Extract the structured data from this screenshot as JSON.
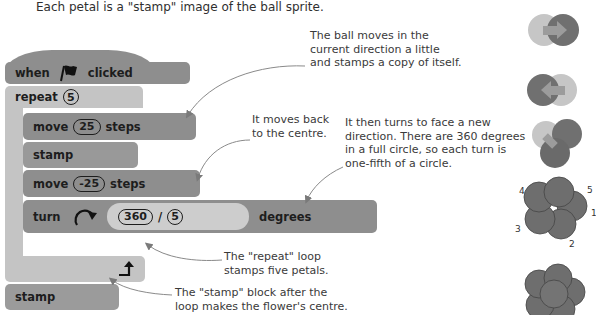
{
  "intro": {
    "line1_partial": "...",
    "line2": "Each petal is a \"stamp\" image of the ball sprite."
  },
  "script": {
    "hat": {
      "when": "when",
      "icon": "green-flag-icon",
      "clicked": "clicked"
    },
    "repeat": {
      "label": "repeat",
      "count": "5",
      "end_icon": "loop-arrow-icon"
    },
    "move1": {
      "label": "move",
      "value": "25",
      "suffix": "steps"
    },
    "stamp1": {
      "label": "stamp"
    },
    "move2": {
      "label": "move",
      "value": "-25",
      "suffix": "steps"
    },
    "turn": {
      "label": "turn",
      "icon": "rotate-clockwise-icon",
      "numerator": "360",
      "operator": "/",
      "denominator": "5",
      "suffix": "degrees"
    },
    "stamp2": {
      "label": "stamp"
    }
  },
  "annotations": {
    "a1": [
      "The ball moves in the",
      "current direction a little",
      "and stamps a copy of itself."
    ],
    "a2": [
      "It moves back",
      "to the centre."
    ],
    "a3": [
      "It then turns to face a new",
      "direction. There are 360 degrees",
      "in a full circle, so each turn is",
      "one-fifth of a circle."
    ],
    "a4": [
      "The \"repeat\" loop",
      "stamps five petals."
    ],
    "a5": [
      "The \"stamp\" block after the",
      "loop makes the flower's centre."
    ]
  },
  "sprites": {
    "petal_numbers": [
      "1",
      "2",
      "3",
      "4",
      "5"
    ]
  },
  "colors": {
    "event_block": "#8e8e8e",
    "control_block": "#c4c4c4",
    "motion_block": "#8e8e8e",
    "ball_light": "#c6c6c6",
    "ball_dark": "#6e6e6e"
  }
}
